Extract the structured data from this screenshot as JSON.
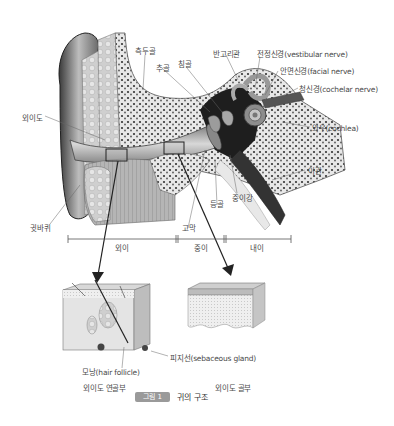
{
  "figure": {
    "badge": "그림 1",
    "title": "귀의 구조"
  },
  "labels": {
    "temporal_bone": "측두골",
    "malleus": "추골",
    "incus": "침골",
    "semicircular_canals": "반고리관",
    "vestibular_nerve": "전정신경(vestibular nerve)",
    "facial_nerve": "안면신경(facial nerve)",
    "cochlear_nerve": "청신경(cochelar nerve)",
    "cochlea": "와우(cochlea)",
    "eustachian_tube": "이관",
    "stapes": "등골",
    "middle_ear_cavity": "중이강",
    "tympanic_membrane": "고막",
    "external_auditory_canal": "외이도",
    "auricle": "귓바퀴",
    "hair_follicle": "모낭(hair follicle)",
    "sebaceous_gland": "피지선(sebaceous gland)",
    "cartilaginous_part": "외이도 연골부",
    "bony_part": "외이도 골부"
  },
  "regions": {
    "outer_ear": "외이",
    "middle_ear": "중이",
    "inner_ear": "내이"
  },
  "colors": {
    "line": "#333333",
    "badge": "#9a9a9a",
    "tissue_dark": "#222222",
    "tissue_mid": "#9a9a9a",
    "tissue_light": "#dcdcdc"
  }
}
